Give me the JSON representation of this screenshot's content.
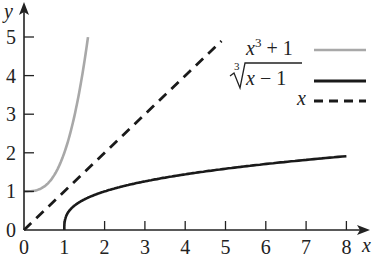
{
  "chart_data": {
    "type": "line",
    "title": "",
    "xlabel": "x",
    "ylabel": "y",
    "xlim": [
      0,
      8
    ],
    "ylim": [
      0,
      5
    ],
    "x_ticks": [
      "0",
      "1",
      "2",
      "3",
      "4",
      "5",
      "6",
      "7",
      "8"
    ],
    "y_ticks": [
      "0",
      "1",
      "2",
      "3",
      "4",
      "5"
    ],
    "grid": false,
    "legend_position": "upper right",
    "series": [
      {
        "name": "x^3 + 1",
        "label_display": "x³ + 1",
        "style": "solid",
        "color": "#a8a8a8",
        "x": [
          0,
          0.25,
          0.5,
          0.75,
          1.0,
          1.1,
          1.2,
          1.3,
          1.4,
          1.5,
          1.587
        ],
        "y": [
          1,
          1.016,
          1.125,
          1.422,
          2.0,
          2.331,
          2.728,
          3.197,
          3.744,
          4.375,
          5.0
        ]
      },
      {
        "name": "cbrt(x - 1)",
        "label_display": "∛(x − 1)",
        "style": "solid",
        "color": "#1a1a1a",
        "x": [
          1,
          1.01,
          1.1,
          1.5,
          2,
          3,
          4,
          5,
          6,
          7,
          8
        ],
        "y": [
          0,
          0.215,
          0.464,
          0.794,
          1.0,
          1.26,
          1.442,
          1.587,
          1.71,
          1.817,
          1.913
        ]
      },
      {
        "name": "x",
        "label_display": "x",
        "style": "dashed",
        "color": "#1a1a1a",
        "x": [
          0,
          4.9
        ],
        "y": [
          0,
          4.9
        ]
      }
    ]
  },
  "axes": {
    "x_label": "x",
    "y_label": "y",
    "x_ticks": [
      "0",
      "1",
      "2",
      "3",
      "4",
      "5",
      "6",
      "7",
      "8"
    ],
    "y_ticks": [
      "0",
      "1",
      "2",
      "3",
      "4",
      "5"
    ]
  },
  "legend": {
    "items": [
      {
        "pre": "x",
        "sup": "3",
        "post": " + 1",
        "color": "#a8a8a8",
        "style": "solid"
      },
      {
        "radical_index": "3",
        "radicand": "x − 1",
        "color": "#1a1a1a",
        "style": "solid"
      },
      {
        "text": "x",
        "color": "#1a1a1a",
        "style": "dashed"
      }
    ]
  }
}
